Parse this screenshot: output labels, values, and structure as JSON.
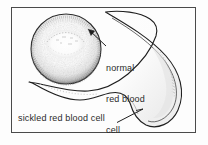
{
  "figure": {
    "background_color": "#fdfdfd",
    "border_color": "#4a4a4a",
    "ink_color": "#1a1a1a",
    "label_color": "#2a2a2a"
  },
  "labels": {
    "normal_cell": {
      "name": "normal-red-blood-cell-label",
      "line1": "normal",
      "line2": "red blood",
      "line3": "cell"
    },
    "sickled_cell": {
      "name": "sickled-red-blood-cell-label",
      "text": "sickled red blood cell"
    }
  },
  "shapes": {
    "normal_cell": {
      "name": "normal-red-blood-cell-drawing",
      "description": "shaded biconcave disc with pale central depression",
      "center_x": 66,
      "center_y": 49,
      "radius_x": 35,
      "radius_y": 35
    },
    "sickled_cell": {
      "name": "sickled-red-blood-cell-drawing",
      "description": "elongated crescent shaped cell with pointed tips",
      "upper_tip_x": 105,
      "upper_tip_y": 12,
      "left_tip_x": 29,
      "left_tip_y": 82
    }
  },
  "pointers": {
    "normal": {
      "name": "normal-cell-pointer-arrow",
      "from_x": 106,
      "from_y": 46,
      "to_x": 88,
      "to_y": 29
    },
    "sickled": {
      "name": "sickled-cell-pointer-line",
      "from_x": 118,
      "from_y": 122,
      "to_x": 142,
      "to_y": 110
    }
  }
}
